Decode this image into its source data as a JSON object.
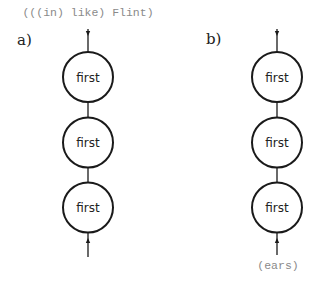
{
  "diagram": {
    "panels": [
      {
        "id": "a",
        "label": "a)",
        "top_annotation": "(((in) like) Flint)",
        "bottom_annotation": "",
        "nodes": [
          {
            "label": "first"
          },
          {
            "label": "first"
          },
          {
            "label": "first"
          }
        ],
        "top_arrow": "down",
        "bottom_arrow": "up"
      },
      {
        "id": "b",
        "label": "b)",
        "top_annotation": "",
        "bottom_annotation": "(ears)",
        "nodes": [
          {
            "label": "first"
          },
          {
            "label": "first"
          },
          {
            "label": "first"
          }
        ],
        "top_arrow": "down",
        "bottom_arrow": "up"
      }
    ],
    "colors": {
      "stroke": "#1a1a1a",
      "annotation": "#8a8a8a",
      "background": "#ffffff"
    }
  }
}
